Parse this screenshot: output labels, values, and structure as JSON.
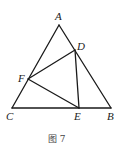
{
  "figure": {
    "caption": "图 7",
    "points": [
      {
        "name": "A",
        "x": 59,
        "y": 25,
        "lx": 55,
        "ly": 20
      },
      {
        "name": "B",
        "x": 111,
        "y": 108,
        "lx": 107,
        "ly": 120
      },
      {
        "name": "C",
        "x": 12,
        "y": 108,
        "lx": 6,
        "ly": 120
      },
      {
        "name": "D",
        "x": 75,
        "y": 50,
        "lx": 77,
        "ly": 50
      },
      {
        "name": "E",
        "x": 79,
        "y": 108,
        "lx": 74,
        "ly": 120
      },
      {
        "name": "F",
        "x": 28,
        "y": 79,
        "lx": 18,
        "ly": 82
      }
    ],
    "segments": [
      [
        "A",
        "B"
      ],
      [
        "B",
        "C"
      ],
      [
        "C",
        "A"
      ],
      [
        "D",
        "E"
      ],
      [
        "E",
        "F"
      ],
      [
        "F",
        "D"
      ]
    ]
  }
}
